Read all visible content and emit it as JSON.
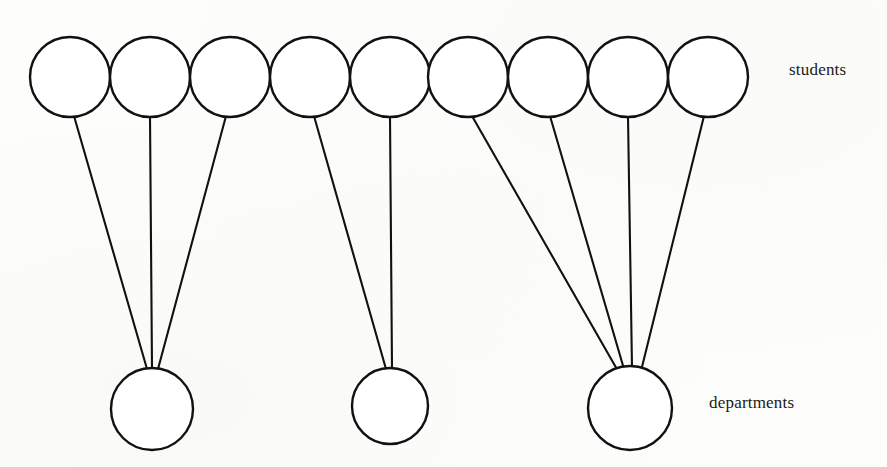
{
  "figure": {
    "type": "bipartite-graph",
    "background_color": "#fdfdfb",
    "stroke_color": "#111111",
    "node_fill_color": "#ffffff",
    "width": 887,
    "height": 467
  },
  "labels": {
    "top_row": "students",
    "bottom_row": "departments"
  },
  "chart_data": {
    "type": "diagram",
    "title": "",
    "subtype": "bipartite graph (many-to-one relationship)",
    "sets": [
      {
        "name": "students",
        "label": "students",
        "count": 9,
        "row": "top",
        "node_radius": 40,
        "node_center_y": 77,
        "nodes": [
          {
            "id": "s1",
            "cx": 70,
            "cy": 77,
            "r": 40,
            "label": ""
          },
          {
            "id": "s2",
            "cx": 150,
            "cy": 77,
            "r": 40,
            "label": ""
          },
          {
            "id": "s3",
            "cx": 230,
            "cy": 77,
            "r": 40,
            "label": ""
          },
          {
            "id": "s4",
            "cx": 310,
            "cy": 77,
            "r": 40,
            "label": ""
          },
          {
            "id": "s5",
            "cx": 390,
            "cy": 77,
            "r": 40,
            "label": ""
          },
          {
            "id": "s6",
            "cx": 468,
            "cy": 77,
            "r": 40,
            "label": ""
          },
          {
            "id": "s7",
            "cx": 548,
            "cy": 77,
            "r": 40,
            "label": ""
          },
          {
            "id": "s8",
            "cx": 628,
            "cy": 77,
            "r": 40,
            "label": ""
          },
          {
            "id": "s9",
            "cx": 708,
            "cy": 77,
            "r": 40,
            "label": ""
          }
        ]
      },
      {
        "name": "departments",
        "label": "departments",
        "count": 3,
        "row": "bottom",
        "node_radius": 41,
        "nodes": [
          {
            "id": "d1",
            "cx": 152,
            "cy": 409,
            "r": 41,
            "label": ""
          },
          {
            "id": "d2",
            "cx": 390,
            "cy": 406,
            "r": 38,
            "label": ""
          },
          {
            "id": "d3",
            "cx": 630,
            "cy": 408,
            "r": 42,
            "label": ""
          }
        ]
      }
    ],
    "edges": [
      {
        "from": "s1",
        "to": "d1",
        "x1": 74,
        "y1": 116,
        "x2": 147,
        "y2": 369
      },
      {
        "from": "s2",
        "to": "d1",
        "x1": 150,
        "y1": 117,
        "x2": 152,
        "y2": 368
      },
      {
        "from": "s3",
        "to": "d1",
        "x1": 226,
        "y1": 116,
        "x2": 158,
        "y2": 369
      },
      {
        "from": "s4",
        "to": "d2",
        "x1": 314,
        "y1": 116,
        "x2": 386,
        "y2": 369
      },
      {
        "from": "s5",
        "to": "d2",
        "x1": 390,
        "y1": 117,
        "x2": 392,
        "y2": 368
      },
      {
        "from": "s6",
        "to": "d3",
        "x1": 472,
        "y1": 116,
        "x2": 618,
        "y2": 371
      },
      {
        "from": "s7",
        "to": "d3",
        "x1": 550,
        "y1": 116,
        "x2": 624,
        "y2": 369
      },
      {
        "from": "s8",
        "to": "d3",
        "x1": 628,
        "y1": 117,
        "x2": 632,
        "y2": 367
      },
      {
        "from": "s9",
        "to": "d3",
        "x1": 704,
        "y1": 116,
        "x2": 641,
        "y2": 371
      }
    ],
    "edge_count": 9,
    "degree_by_department": [
      {
        "department": "d1",
        "students": [
          "s1",
          "s2",
          "s3"
        ],
        "degree": 3
      },
      {
        "department": "d2",
        "students": [
          "s4",
          "s5"
        ],
        "degree": 2
      },
      {
        "department": "d3",
        "students": [
          "s6",
          "s7",
          "s8",
          "s9"
        ],
        "degree": 4
      }
    ],
    "degree_by_student": 1,
    "legend": [],
    "grid": false,
    "axis_labels": {
      "top": "students",
      "bottom": "departments"
    }
  }
}
